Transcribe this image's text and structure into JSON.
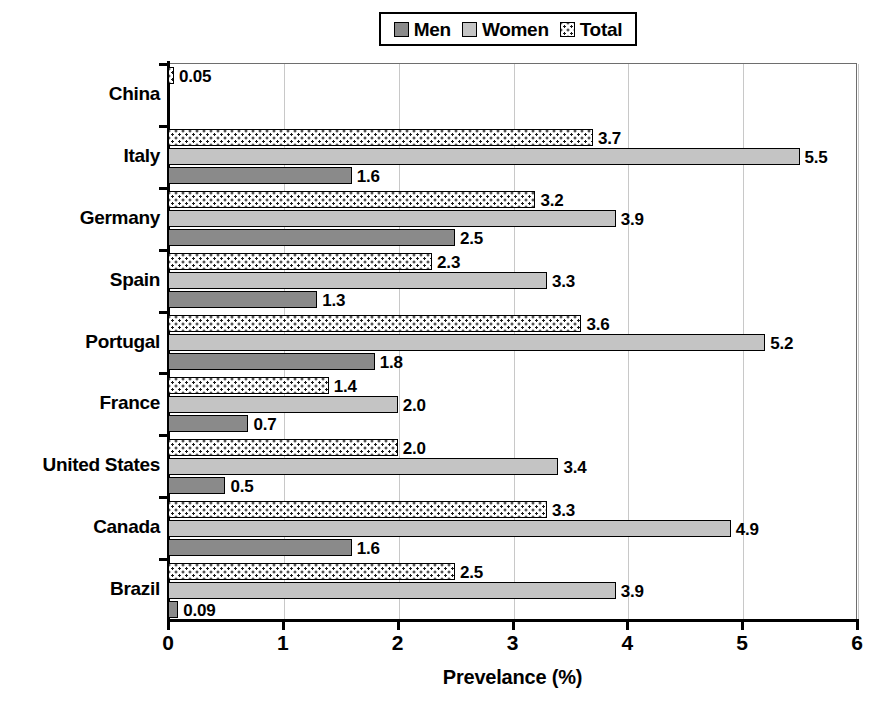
{
  "legend": {
    "position": "top-center",
    "entries": [
      {
        "label": "Men",
        "swatch": "men-swatch",
        "color": "#8a8a8a",
        "pattern": "solid-dark-gray"
      },
      {
        "label": "Women",
        "swatch": "women-swatch",
        "color": "#c4c4c4",
        "pattern": "solid-light-gray"
      },
      {
        "label": "Total",
        "swatch": "total-swatch",
        "color": "#ffffff",
        "pattern": "white-with-dark-dots"
      }
    ]
  },
  "axis": {
    "x_title": "Prevelance (%)",
    "x_ticks": [
      "0",
      "1",
      "2",
      "3",
      "4",
      "5",
      "6"
    ]
  },
  "chart_data": {
    "type": "bar",
    "orientation": "horizontal",
    "title": "",
    "subtitle": "",
    "xlabel": "Prevelance (%)",
    "ylabel": "",
    "xlim": [
      0,
      6
    ],
    "xticks": [
      0,
      1,
      2,
      3,
      4,
      5,
      6
    ],
    "grid": "vertical-gridlines-only",
    "legend": [
      "Men",
      "Women",
      "Total"
    ],
    "legend_position": "top-center",
    "categories": [
      "China",
      "Italy",
      "Germany",
      "Spain",
      "Portugal",
      "France",
      "United States",
      "Canada",
      "Brazil"
    ],
    "series": [
      {
        "name": "Men",
        "values": [
          null,
          1.6,
          2.5,
          1.3,
          1.8,
          0.7,
          0.5,
          1.6,
          0.09
        ],
        "labels": [
          "",
          "1.6",
          "2.5",
          "1.3",
          "1.8",
          "0.7",
          "0.5",
          "1.6",
          "0.09"
        ]
      },
      {
        "name": "Women",
        "values": [
          null,
          5.5,
          3.9,
          3.3,
          5.2,
          2.0,
          3.4,
          4.9,
          3.9
        ],
        "labels": [
          "",
          "5.5",
          "3.9",
          "3.3",
          "5.2",
          "2.0",
          "3.4",
          "4.9",
          "3.9"
        ]
      },
      {
        "name": "Total",
        "values": [
          0.05,
          3.7,
          3.2,
          2.3,
          3.6,
          1.4,
          2.0,
          3.3,
          2.5
        ],
        "labels": [
          "0.05",
          "3.7",
          "3.2",
          "2.3",
          "3.6",
          "1.4",
          "2.0",
          "3.3",
          "2.5"
        ]
      }
    ]
  }
}
